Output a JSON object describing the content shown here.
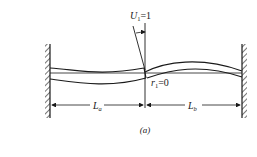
{
  "figure": {
    "rotation_label": {
      "symbol": "U",
      "subscript": "1",
      "value": "=1"
    },
    "displacement_label": {
      "symbol": "r",
      "subscript": "1",
      "value": "=0"
    },
    "span_a_label": {
      "symbol": "L",
      "subscript": "a"
    },
    "span_b_label": {
      "symbol": "L",
      "subscript": "b"
    },
    "caption": "(a)"
  },
  "colors": {
    "ink": "#1a1a1a",
    "background": "#ffffff"
  }
}
